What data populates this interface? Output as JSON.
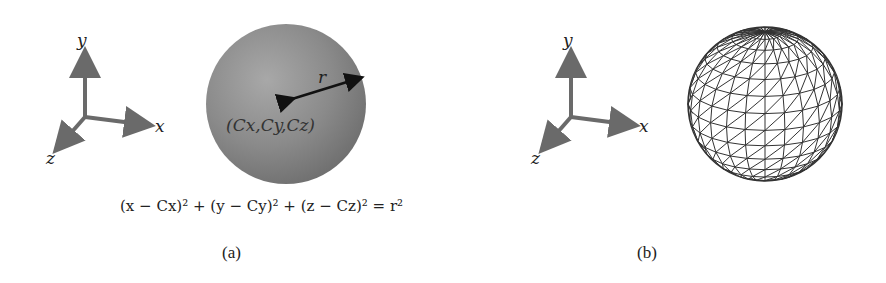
{
  "figure": {
    "panels": [
      {
        "id": "a",
        "caption": "(a)",
        "axes": {
          "x_label": "x",
          "y_label": "y",
          "z_label": "z"
        },
        "sphere": {
          "style": "shaded",
          "radius_label": "r",
          "center_label": "(Cx,Cy,Cz)",
          "color": "#8a8a8a"
        },
        "equation": "(x − Cx)² + (y − Cy)² + (z − Cz)² = r²"
      },
      {
        "id": "b",
        "caption": "(b)",
        "axes": {
          "x_label": "x",
          "y_label": "y",
          "z_label": "z"
        },
        "sphere": {
          "style": "triangle-mesh wireframe",
          "color": "#333333"
        }
      }
    ],
    "colors": {
      "axis_arrow": "#6a6a6a",
      "background": "#ffffff"
    }
  }
}
